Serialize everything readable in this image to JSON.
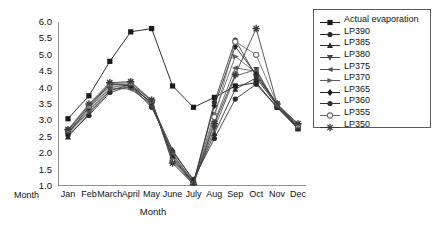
{
  "chart_data": {
    "type": "line",
    "title": "",
    "xlabel": "Month",
    "ylabel": "Evaporation mm³",
    "ylim": [
      1.0,
      6.0
    ],
    "grid": false,
    "legend_position": "right-outside",
    "categories": [
      "Jan",
      "Feb",
      "March",
      "April",
      "May",
      "June",
      "July",
      "Aug",
      "Sep",
      "Oct",
      "Nov",
      "Dec"
    ],
    "ytick_labels": [
      "6.0",
      "5.5",
      "5.0",
      "4.5",
      "4.0",
      "3.5",
      "3.0",
      "2.5",
      "2.0",
      "1.5",
      "1.0"
    ],
    "ytick_values": [
      6.0,
      5.5,
      5.0,
      4.5,
      4.0,
      3.5,
      3.0,
      2.5,
      2.0,
      1.5,
      1.0
    ],
    "series": [
      {
        "name": "Actual evaporation",
        "marker": "square",
        "color": "#1a1a1a",
        "values": [
          3.05,
          3.75,
          4.8,
          5.7,
          5.8,
          4.05,
          3.4,
          3.7,
          4.05,
          4.15,
          3.4,
          2.75
        ]
      },
      {
        "name": "LP390",
        "marker": "circle",
        "color": "#2b2b2b",
        "values": [
          2.55,
          3.15,
          3.85,
          4.05,
          3.4,
          2.05,
          1.2,
          2.45,
          3.65,
          4.1,
          3.4,
          2.75
        ]
      },
      {
        "name": "LP385",
        "marker": "triangle-up",
        "color": "#2b2b2b",
        "values": [
          2.5,
          3.2,
          3.9,
          4.1,
          3.5,
          2.1,
          1.15,
          2.6,
          3.95,
          4.3,
          3.45,
          2.75
        ]
      },
      {
        "name": "LP380",
        "marker": "triangle-down",
        "color": "#444444",
        "values": [
          2.6,
          3.25,
          3.95,
          4.0,
          3.45,
          2.0,
          1.1,
          2.75,
          4.35,
          4.55,
          3.45,
          2.8
        ]
      },
      {
        "name": "LP375",
        "marker": "left-arrow",
        "color": "#555555",
        "values": [
          2.62,
          3.3,
          4.0,
          3.95,
          3.5,
          1.95,
          1.12,
          2.95,
          4.6,
          4.5,
          3.45,
          2.8
        ]
      },
      {
        "name": "LP370",
        "marker": "right-arrow",
        "color": "#5e5e5e",
        "values": [
          2.65,
          3.35,
          4.05,
          4.0,
          3.55,
          1.9,
          1.1,
          3.2,
          4.95,
          4.45,
          3.5,
          2.8
        ]
      },
      {
        "name": "LP365",
        "marker": "diamond",
        "color": "#1f1f1f",
        "values": [
          2.6,
          3.4,
          4.1,
          4.05,
          3.55,
          1.85,
          1.1,
          3.45,
          5.25,
          4.4,
          3.5,
          2.8
        ]
      },
      {
        "name": "LP360",
        "marker": "circle",
        "color": "#333333",
        "values": [
          2.68,
          3.45,
          4.1,
          4.1,
          3.6,
          1.8,
          1.08,
          3.55,
          5.45,
          4.35,
          3.5,
          2.85
        ]
      },
      {
        "name": "LP355",
        "marker": "circle-open",
        "color": "#6a6a6a",
        "values": [
          2.7,
          3.45,
          4.12,
          4.15,
          3.6,
          1.75,
          1.05,
          3.1,
          5.4,
          5.0,
          3.5,
          2.85
        ]
      },
      {
        "name": "LP350",
        "marker": "star",
        "color": "#3a3a3a",
        "values": [
          2.72,
          3.5,
          4.15,
          4.18,
          3.62,
          1.7,
          1.05,
          2.9,
          4.4,
          5.8,
          3.5,
          2.9
        ]
      }
    ]
  },
  "axis": {
    "x_left_label": "Month",
    "x_title": "Month",
    "y_title_main": "Evaporation mm",
    "y_title_sup": "3"
  }
}
